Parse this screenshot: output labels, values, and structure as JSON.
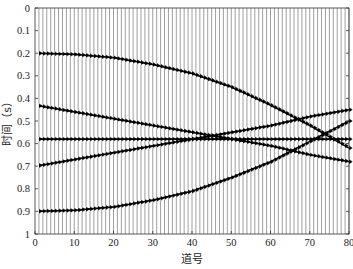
{
  "chart_data": {
    "type": "line",
    "subtype": "seismic-wiggle",
    "title": "",
    "xlabel": "道号",
    "ylabel": "时间（s）",
    "xlim": [
      0,
      80
    ],
    "ylim": [
      0,
      1
    ],
    "y_inverted": true,
    "x_ticks": [
      0,
      10,
      20,
      30,
      40,
      50,
      60,
      70,
      80
    ],
    "y_ticks": [
      0,
      0.1,
      0.2,
      0.3,
      0.4,
      0.5,
      0.6,
      0.7,
      0.8,
      0.9,
      1
    ],
    "y_tick_labels": [
      "0",
      "0.1",
      "0.2",
      "0.3",
      "0.4",
      "0.5",
      "0.6",
      "0.7",
      "0.8",
      "0.9",
      "1"
    ],
    "trace_count": 80,
    "grid": false,
    "legend": null,
    "series": [
      {
        "name": "event-1",
        "x": [
          0,
          10,
          20,
          30,
          40,
          50,
          60,
          70,
          80
        ],
        "values": [
          0.2,
          0.205,
          0.22,
          0.25,
          0.29,
          0.35,
          0.43,
          0.52,
          0.62
        ]
      },
      {
        "name": "event-2",
        "x": [
          0,
          10,
          20,
          30,
          40,
          50,
          60,
          70,
          80
        ],
        "values": [
          0.43,
          0.46,
          0.49,
          0.52,
          0.55,
          0.58,
          0.61,
          0.65,
          0.68
        ]
      },
      {
        "name": "event-3",
        "x": [
          0,
          10,
          20,
          30,
          40,
          50,
          60,
          70,
          80
        ],
        "values": [
          0.58,
          0.58,
          0.58,
          0.58,
          0.58,
          0.58,
          0.58,
          0.58,
          0.58
        ]
      },
      {
        "name": "event-4",
        "x": [
          0,
          10,
          20,
          30,
          40,
          50,
          60,
          70,
          80
        ],
        "values": [
          0.7,
          0.67,
          0.64,
          0.61,
          0.58,
          0.55,
          0.52,
          0.48,
          0.45
        ]
      },
      {
        "name": "event-5",
        "x": [
          0,
          10,
          20,
          30,
          40,
          50,
          60,
          70,
          80
        ],
        "values": [
          0.9,
          0.895,
          0.88,
          0.85,
          0.81,
          0.75,
          0.68,
          0.59,
          0.5
        ]
      }
    ]
  }
}
